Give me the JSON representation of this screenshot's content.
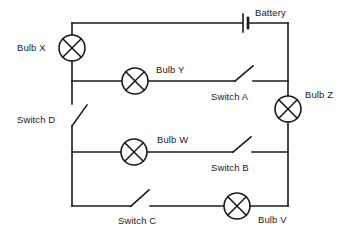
{
  "diagram": {
    "stroke_color": "#1a1a1a",
    "background_color": "#ffffff",
    "labels": {
      "bulb_x": "Bulb X",
      "bulb_y": "Bulb Y",
      "bulb_z": "Bulb Z",
      "bulb_w": "Bulb W",
      "bulb_v": "Bulb V",
      "switch_a": "Switch A",
      "switch_b": "Switch B",
      "switch_c": "Switch C",
      "switch_d": "Switch D",
      "battery": "Battery"
    },
    "components": [
      {
        "id": "bulb-x",
        "type": "lamp",
        "label": "Bulb X",
        "cx": 72,
        "cy": 48,
        "r": 13,
        "state": "in-series-top-left"
      },
      {
        "id": "bulb-y",
        "type": "lamp",
        "label": "Bulb Y",
        "cx": 135,
        "cy": 81,
        "r": 13,
        "state": "branch-1"
      },
      {
        "id": "bulb-z",
        "type": "lamp",
        "label": "Bulb Z",
        "cx": 288,
        "cy": 109,
        "r": 13,
        "state": "in-series-right"
      },
      {
        "id": "bulb-w",
        "type": "lamp",
        "label": "Bulb W",
        "cx": 134,
        "cy": 152,
        "r": 13,
        "state": "branch-2"
      },
      {
        "id": "bulb-v",
        "type": "lamp",
        "label": "Bulb V",
        "cx": 237,
        "cy": 206,
        "r": 13,
        "state": "branch-3"
      },
      {
        "id": "switch-a",
        "type": "switch",
        "label": "Switch A",
        "x": 235,
        "y": 81,
        "open": true,
        "branch": "branch-1"
      },
      {
        "id": "switch-b",
        "type": "switch",
        "label": "Switch B",
        "x": 233,
        "y": 152,
        "open": true,
        "branch": "branch-2"
      },
      {
        "id": "switch-c",
        "type": "switch",
        "label": "Switch C",
        "x": 131,
        "y": 206,
        "open": true,
        "branch": "branch-3"
      },
      {
        "id": "switch-d",
        "type": "switch",
        "label": "Switch D",
        "x": 72,
        "y": 126,
        "open": true,
        "branch": "left-rail"
      },
      {
        "id": "battery",
        "type": "battery",
        "label": "Battery",
        "x": 245,
        "y": 23,
        "cells": 1
      }
    ]
  }
}
